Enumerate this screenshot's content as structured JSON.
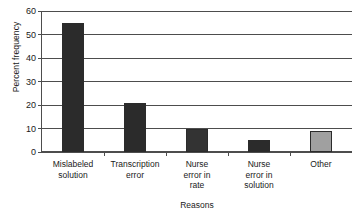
{
  "chart_data": {
    "type": "bar",
    "title": "",
    "xlabel": "Reasons",
    "ylabel": "Percent frequency",
    "categories": [
      "Mislabeled solution",
      "Transcription error",
      "Nurse error in rate",
      "Nurse error in solution",
      "Other"
    ],
    "category_lines": [
      [
        "Mislabeled",
        "solution"
      ],
      [
        "Transcription",
        "error"
      ],
      [
        "Nurse",
        "error in",
        "rate"
      ],
      [
        "Nurse",
        "error in",
        "solution"
      ],
      [
        "Other"
      ]
    ],
    "values": [
      55,
      21,
      10,
      5,
      9
    ],
    "bar_colors": [
      "#2b2b2b",
      "#2b2b2b",
      "#333333",
      "#2b2b2b",
      "#a0a0a0"
    ],
    "bar_border_color": "#2b2b2b",
    "ylim": [
      0,
      60
    ],
    "yticks": [
      0,
      10,
      20,
      30,
      40,
      50,
      60
    ],
    "ytick_labels": [
      "0",
      "10",
      "20",
      "30",
      "40",
      "50",
      "60"
    ],
    "grid": true,
    "grid_axis": "y",
    "legend": "none",
    "axis_color": "#4d4d4d"
  }
}
